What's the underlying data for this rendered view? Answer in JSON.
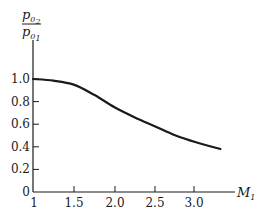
{
  "chart_data": {
    "type": "line",
    "title": "",
    "xlabel": "M1",
    "ylabel": "p02/p01",
    "xlim": [
      1.0,
      3.5
    ],
    "ylim": [
      0,
      1.2
    ],
    "grid": false,
    "legend": null,
    "x_ticks": [
      "1",
      "1.5",
      "2.0",
      "2.5",
      "3.0"
    ],
    "y_ticks": [
      "0",
      "0.2",
      "0.4",
      "0.6",
      "0.8",
      "1.0"
    ],
    "series": [
      {
        "name": "p02/p01",
        "x": [
          1.0,
          1.25,
          1.5,
          1.75,
          2.0,
          2.25,
          2.5,
          2.75,
          3.0,
          3.3
        ],
        "y": [
          1.0,
          0.985,
          0.95,
          0.86,
          0.75,
          0.66,
          0.58,
          0.5,
          0.44,
          0.38
        ]
      }
    ]
  },
  "labels": {
    "x_axis": {
      "main": "M",
      "sub": "1"
    },
    "y_axis": {
      "num_main": "p",
      "num_sub": "0",
      "num_subsub": "2",
      "den_main": "p",
      "den_sub": "0",
      "den_subsub": "1"
    }
  }
}
